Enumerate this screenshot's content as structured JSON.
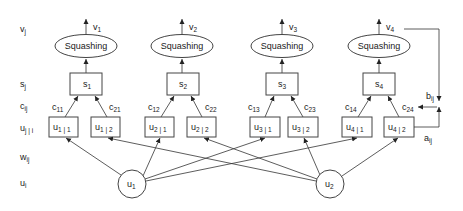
{
  "diagram": {
    "type": "capsule-network-dynamic-routing",
    "row_labels": [
      {
        "id": "v",
        "base": "v",
        "sub": "j",
        "y": 32
      },
      {
        "id": "s",
        "base": "s",
        "sub": "j",
        "y": 86
      },
      {
        "id": "c",
        "base": "c",
        "sub": "ij",
        "y": 109
      },
      {
        "id": "uhat",
        "base": "u",
        "sub": "j | i",
        "y": 131
      },
      {
        "id": "w",
        "base": "w",
        "sub": "ij",
        "y": 160
      },
      {
        "id": "u",
        "base": "u",
        "sub": "i",
        "y": 186
      }
    ],
    "squash_label": "Squashing",
    "capsules": [
      {
        "j": "1",
        "v": "v",
        "v_sub": "1",
        "s": "s",
        "s_sub": "1",
        "c_left": "11",
        "c_right": "21",
        "u_left_sub": "1 | 1",
        "u_right_sub": "1 | 2"
      },
      {
        "j": "2",
        "v": "v",
        "v_sub": "2",
        "s": "s",
        "s_sub": "2",
        "c_left": "12",
        "c_right": "22",
        "u_left_sub": "2 | 1",
        "u_right_sub": "2 | 2"
      },
      {
        "j": "3",
        "v": "v",
        "v_sub": "3",
        "s": "s",
        "s_sub": "3",
        "c_left": "13",
        "c_right": "23",
        "u_left_sub": "3 | 1",
        "u_right_sub": "3 | 2"
      },
      {
        "j": "4",
        "v": "v",
        "v_sub": "4",
        "s": "s",
        "s_sub": "4",
        "c_left": "14",
        "c_right": "24",
        "u_left_sub": "4 | 1",
        "u_right_sub": "4 | 2"
      }
    ],
    "inputs": [
      {
        "base": "u",
        "sub": "1"
      },
      {
        "base": "u",
        "sub": "2"
      }
    ],
    "feedback": {
      "b_base": "b",
      "b_sub": "ij",
      "a_base": "a",
      "a_sub": "ij"
    },
    "colors": {
      "stroke": "#444444",
      "text": "#1a1a1a",
      "background": "#ffffff"
    }
  }
}
